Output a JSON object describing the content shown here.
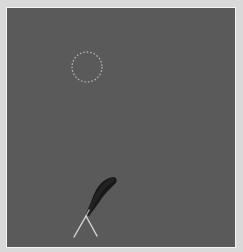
{
  "game": {
    "background_color": "#d9d9d9",
    "field_color": "#5a5a5a",
    "border_color": "#f4f4f4",
    "target": {
      "shape": "dotted-circle",
      "cx": 87,
      "cy": 67,
      "r": 15,
      "color": "#c8c8c8"
    },
    "projectile_trail": {
      "color": "#1a1a1a",
      "from": [
        88,
        216
      ],
      "to": [
        114,
        180
      ]
    },
    "launcher": {
      "vertex": [
        86,
        217
      ],
      "left_leg": [
        74,
        237
      ],
      "right_leg": [
        97,
        236
      ],
      "color": "#d0d0d0"
    }
  }
}
